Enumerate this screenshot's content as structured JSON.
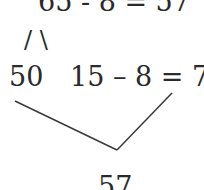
{
  "diagram": {
    "top_equation": "65 - 8 = 57",
    "split_marks": "/ \\",
    "left_part": "50",
    "right_equation": "15 – 8 = 7",
    "result": "57",
    "line_color": "#3a3a3a"
  }
}
